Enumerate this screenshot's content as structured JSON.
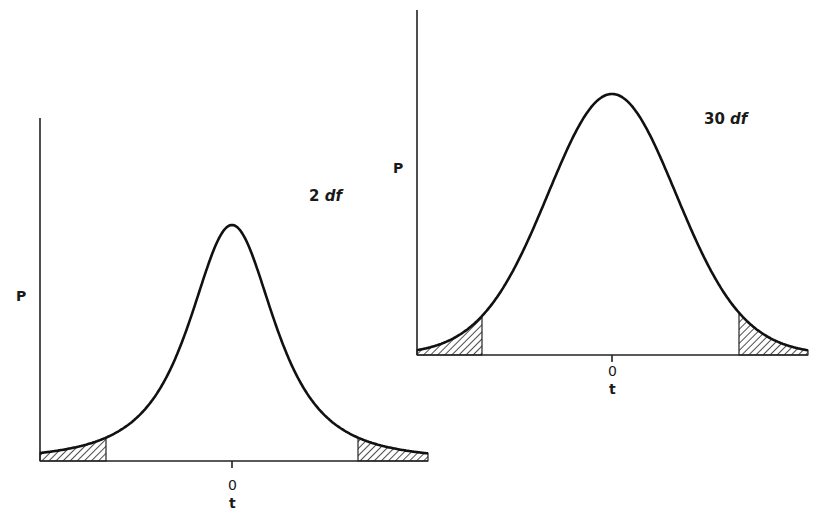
{
  "charts": [
    {
      "id": "left",
      "label": "2 df",
      "df": 2,
      "y_axis_label": "P",
      "x_axis_label": "t",
      "center_tick_label": "0",
      "geometry": {
        "axis_x": 40,
        "axis_top": 118,
        "baseline": 461,
        "x_end": 428,
        "center_x": 232,
        "peak_y": 225,
        "px_per_t": 46.5,
        "shade_left_end": 106,
        "shade_right_start": 358
      },
      "label_pos": {
        "x": 309,
        "y": 189
      },
      "p_pos": {
        "x": 16,
        "y": 289
      },
      "zero_pos": {
        "x": 228,
        "y": 478
      },
      "t_pos": {
        "x": 229,
        "y": 496
      }
    },
    {
      "id": "right",
      "label": "30 df",
      "df": 30,
      "y_axis_label": "P",
      "x_axis_label": "t",
      "center_tick_label": "0",
      "geometry": {
        "axis_x": 417,
        "axis_top": 10,
        "baseline": 355,
        "x_end": 808,
        "center_x": 612,
        "peak_y": 94,
        "px_per_t": 65.7,
        "shade_left_end": 482,
        "shade_right_start": 739
      },
      "label_pos": {
        "x": 704,
        "y": 112
      },
      "p_pos": {
        "x": 393,
        "y": 161
      },
      "zero_pos": {
        "x": 608,
        "y": 364
      },
      "t_pos": {
        "x": 609,
        "y": 382
      }
    }
  ],
  "chart_data": {
    "type": "line",
    "title": "",
    "xlabel": "t",
    "ylabel": "P",
    "series": [
      {
        "name": "2 df",
        "description": "Student t density, 2 degrees of freedom, both tails shaded",
        "x_range": [
          -4.1,
          4.2
        ],
        "shaded_tails": {
          "left_upper_t": -2.7,
          "right_lower_t": 2.7
        }
      },
      {
        "name": "30 df",
        "description": "Student t density, 30 degrees of freedom, both tails shaded",
        "x_range": [
          -3.0,
          3.0
        ],
        "shaded_tails": {
          "left_upper_t": -2.0,
          "right_lower_t": 1.93
        }
      }
    ],
    "x_tick_labels": [
      "0"
    ],
    "grid": false
  }
}
